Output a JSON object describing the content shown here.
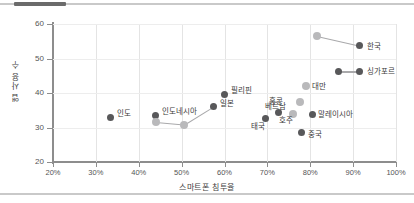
{
  "chart_data": {
    "type": "scatter",
    "title": "",
    "xlabel": "스마트폰 침투율",
    "ylabel": "앱 사용 수",
    "xlim": [
      20,
      100
    ],
    "ylim": [
      20,
      60
    ],
    "xticks": [
      "20%",
      "30%",
      "40%",
      "50%",
      "60%",
      "70%",
      "80%",
      "90%",
      "100%"
    ],
    "xtick_values": [
      20,
      30,
      40,
      50,
      60,
      70,
      80,
      90,
      100
    ],
    "yticks": [
      "20",
      "30",
      "40",
      "50",
      "60"
    ],
    "ytick_values": [
      20,
      30,
      40,
      50,
      60
    ],
    "xtick_format": "percent",
    "grid": "both",
    "legend": "none",
    "colors": {
      "primary": "#58585a",
      "secondary": "#b9b9bb",
      "connector": "#a9a9ab",
      "grid": "#e4e4e4",
      "axis": "#8d8d8d"
    },
    "points": [
      {
        "label": "인도",
        "x": 33.5,
        "y": 33.0,
        "marker": "dark",
        "label_dx": 6,
        "label_dy": -4
      },
      {
        "label": "인도네시아",
        "x": 44.0,
        "y": 33.5,
        "marker": "dark",
        "label_dx": 6,
        "label_dy": -4
      },
      {
        "label": "",
        "x": 44.0,
        "y": 31.5,
        "marker": "light",
        "label_dx": 0,
        "label_dy": 0
      },
      {
        "label": "",
        "x": 50.5,
        "y": 30.8,
        "marker": "light",
        "label_dx": 0,
        "label_dy": 0
      },
      {
        "label": "일본",
        "x": 57.5,
        "y": 36.2,
        "marker": "dark",
        "label_dx": 6,
        "label_dy": -3
      },
      {
        "label": "필리핀",
        "x": 60.0,
        "y": 39.7,
        "marker": "dark",
        "label_dx": 6,
        "label_dy": -4
      },
      {
        "label": "태국",
        "x": 69.5,
        "y": 32.5,
        "marker": "dark",
        "label_dx": -6,
        "label_dy": 7
      },
      {
        "label": "베트남",
        "x": 72.5,
        "y": 34.3,
        "marker": "dark",
        "label_dx": -5,
        "label_dy": -7
      },
      {
        "label": "호주",
        "x": 76.0,
        "y": 33.8,
        "marker": "light",
        "label_dx": -6,
        "label_dy": 6
      },
      {
        "label": "중국",
        "x": 78.0,
        "y": 28.5,
        "marker": "dark",
        "label_dx": 6,
        "label_dy": 1
      },
      {
        "label": "대만",
        "x": 79.0,
        "y": 42.0,
        "marker": "light",
        "label_dx": 6,
        "label_dy": 0
      },
      {
        "label": "말레이시아",
        "x": 80.5,
        "y": 33.8,
        "marker": "dark",
        "label_dx": 6,
        "label_dy": 0
      },
      {
        "label": "홍콩",
        "x": 77.5,
        "y": 37.5,
        "marker": "light",
        "label_dx": -21,
        "label_dy": -1
      },
      {
        "label": "",
        "x": 81.5,
        "y": 56.5,
        "marker": "light",
        "label_dx": 0,
        "label_dy": 0
      },
      {
        "label": "한국",
        "x": 91.5,
        "y": 53.7,
        "marker": "dark",
        "label_dx": 7,
        "label_dy": 0
      },
      {
        "label": "",
        "x": 86.5,
        "y": 46.3,
        "marker": "dark",
        "label_dx": 0,
        "label_dy": 0
      },
      {
        "label": "싱가포르",
        "x": 91.5,
        "y": 46.3,
        "marker": "dark",
        "label_dx": 7,
        "label_dy": 0
      }
    ],
    "connectors": [
      {
        "x1": 44.0,
        "y1": 31.5,
        "x2": 50.5,
        "y2": 30.8
      },
      {
        "x1": 50.5,
        "y1": 30.8,
        "x2": 57.5,
        "y2": 36.2
      },
      {
        "x1": 81.5,
        "y1": 56.5,
        "x2": 91.5,
        "y2": 53.7
      },
      {
        "x1": 86.5,
        "y1": 46.3,
        "x2": 91.5,
        "y2": 46.3
      }
    ]
  }
}
